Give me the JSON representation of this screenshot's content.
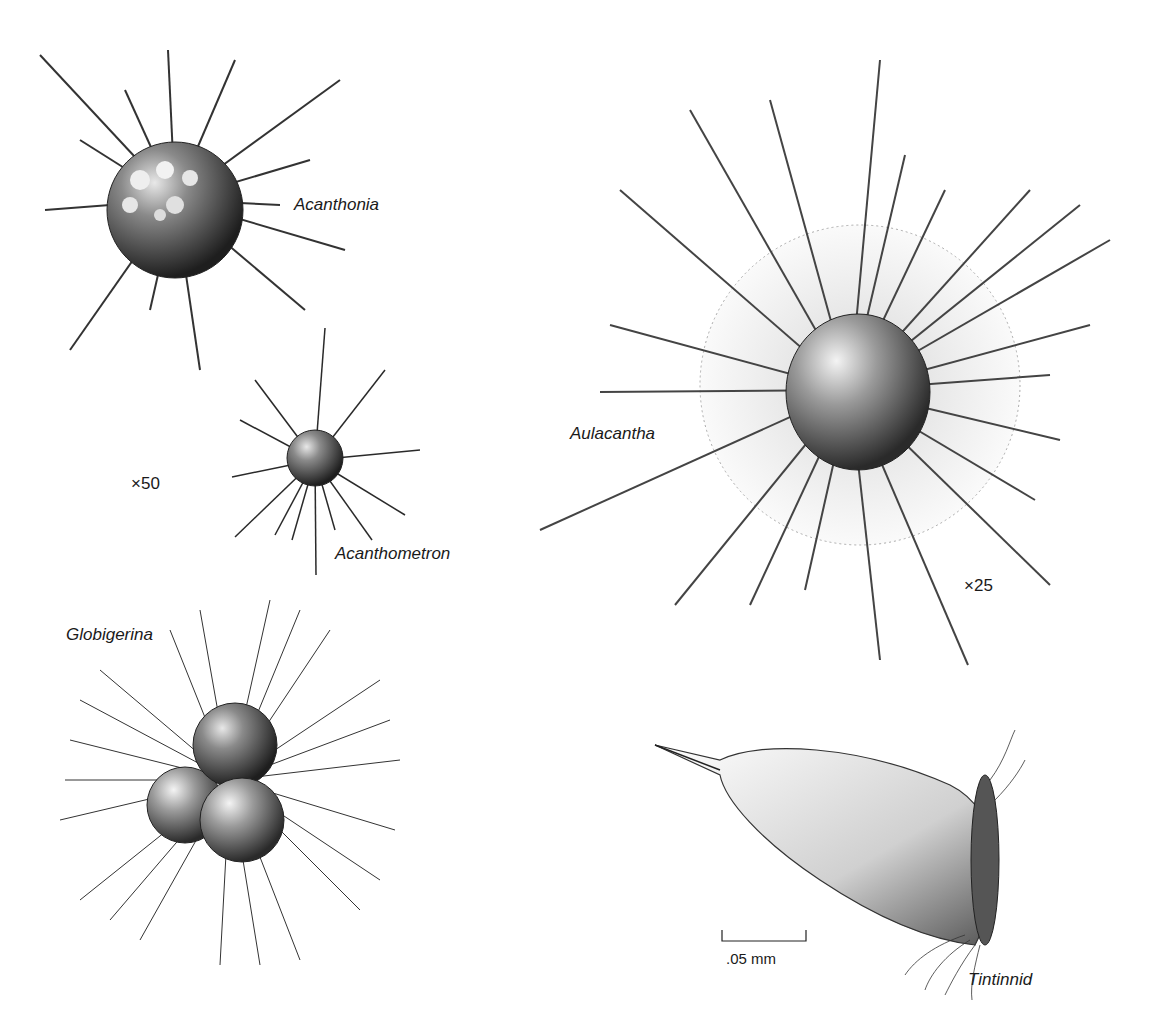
{
  "figure": {
    "specimens": [
      {
        "id": "acanthonia",
        "label": "Acanthonia"
      },
      {
        "id": "acanthometron",
        "label": "Acanthometron"
      },
      {
        "id": "aulacantha",
        "label": "Aulacantha"
      },
      {
        "id": "globigerina",
        "label": "Globigerina"
      },
      {
        "id": "tintinnid",
        "label": "Tintinnid"
      }
    ],
    "magnifications": {
      "left_group": "×50",
      "aulacantha": "×25"
    },
    "scale_bar": {
      "label": ".05 mm"
    }
  }
}
